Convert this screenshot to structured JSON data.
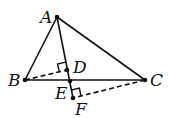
{
  "diagram": {
    "type": "geometry",
    "points": {
      "A": {
        "label": "A",
        "x": 57,
        "y": 17
      },
      "B": {
        "label": "B",
        "x": 25,
        "y": 80
      },
      "C": {
        "label": "C",
        "x": 145,
        "y": 80
      },
      "D": {
        "label": "D",
        "x": 67,
        "y": 70
      },
      "E": {
        "label": "E",
        "x": 70,
        "y": 81
      },
      "F": {
        "label": "F",
        "x": 73,
        "y": 98
      }
    },
    "solid_segments": [
      "AB",
      "AC",
      "BC",
      "AF"
    ],
    "dashed_segments": [
      "BD",
      "CF"
    ],
    "right_angles": [
      "D",
      "F"
    ]
  }
}
